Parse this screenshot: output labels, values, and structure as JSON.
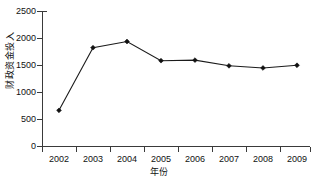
{
  "chart_data": {
    "type": "line",
    "title": "",
    "xlabel": "年份",
    "ylabel": "财政资金投入",
    "categories": [
      "2002",
      "2003",
      "2004",
      "2005",
      "2006",
      "2007",
      "2008",
      "2009"
    ],
    "x": [
      2002,
      2003,
      2004,
      2005,
      2006,
      2007,
      2008,
      2009
    ],
    "values": [
      660,
      1820,
      1935,
      1580,
      1590,
      1485,
      1445,
      1495
    ],
    "series": [
      {
        "name": "财政资金投入",
        "values": [
          660,
          1820,
          1935,
          1580,
          1590,
          1485,
          1445,
          1495
        ]
      }
    ],
    "ylim": [
      0,
      2500
    ],
    "yticks": [
      0,
      500,
      1000,
      1500,
      2000,
      2500
    ],
    "ytick_labels": [
      "0",
      "500",
      "1000",
      "1500",
      "2000",
      "2500"
    ],
    "xtick_labels": [
      "2002",
      "2003",
      "2004",
      "2005",
      "2006",
      "2007",
      "2008",
      "2009"
    ],
    "grid": false,
    "legend": false,
    "legend_position": "none",
    "marker": "diamond",
    "line_color": "#1b1b1b",
    "marker_color": "#111111"
  },
  "axes": {
    "y_title": "财政资金投入",
    "x_title": "年份",
    "y_tick_labels": [
      "2500",
      "2000",
      "1500",
      "1000",
      "500",
      "0"
    ],
    "x_tick_labels": [
      "2002",
      "2003",
      "2004",
      "2005",
      "2006",
      "2007",
      "2008",
      "2009"
    ]
  }
}
